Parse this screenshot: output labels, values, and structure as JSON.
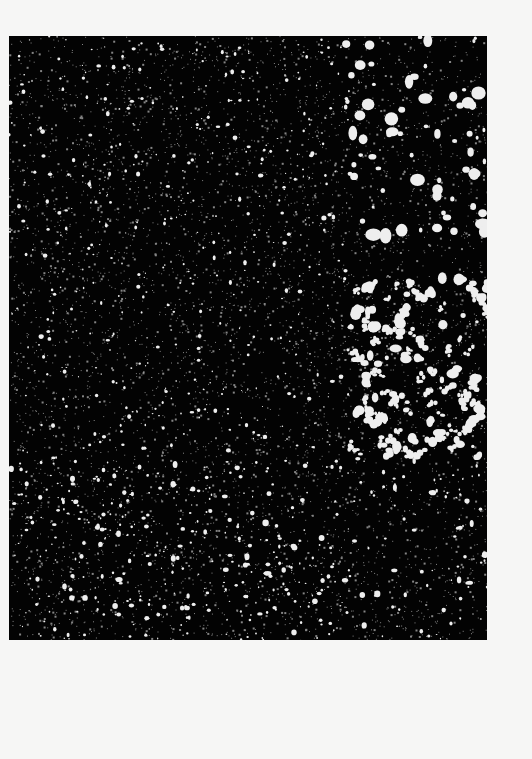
{
  "image": {
    "description": "Scanned print: black rectangular field densely scattered with white speckles (noise / particle pattern) on an off-white page",
    "page_color": "#f6f6f5",
    "panel": {
      "x": 9,
      "y": 36,
      "width": 478,
      "height": 604,
      "color": "#030303",
      "speckle_color": "#eeeeee"
    },
    "regions": [
      {
        "name": "upper-right-large-blobs",
        "x": [
          330,
          478
        ],
        "y": [
          0,
          200
        ],
        "blob_size": "large"
      },
      {
        "name": "right-middle-clustered-worms",
        "x": [
          340,
          478
        ],
        "y": [
          240,
          420
        ],
        "blob_size": "large-irregular"
      },
      {
        "name": "left-and-center-fine-grain",
        "x": [
          0,
          340
        ],
        "y": [
          0,
          604
        ],
        "blob_size": "small"
      },
      {
        "name": "lower-field-mixed",
        "x": [
          0,
          478
        ],
        "y": [
          420,
          604
        ],
        "blob_size": "small-medium"
      }
    ],
    "seed": 7321
  }
}
